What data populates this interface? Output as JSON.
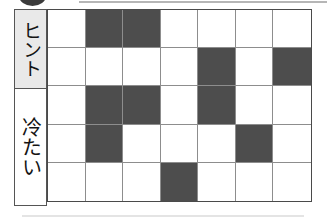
{
  "decorations": {
    "top_blob": "dark-circle-mark",
    "top_rule": "horizontal-divider",
    "bottom_rule": "horizontal-divider"
  },
  "labels": {
    "hint": "ヒント",
    "cold": "冷たい"
  },
  "colors": {
    "filled_cell": "#4d4d4d",
    "empty_cell": "#ffffff",
    "grid_line": "#8d8d8d",
    "grid_border": "#4a4a4a",
    "hint_background": "#e9e9e9",
    "cold_background": "#ffffff"
  },
  "grid": {
    "rows": 5,
    "columns": 7,
    "filled_label": "filled",
    "empty_label": "empty",
    "cells": [
      [
        0,
        1,
        1,
        0,
        0,
        0,
        0
      ],
      [
        0,
        0,
        0,
        0,
        1,
        0,
        1
      ],
      [
        0,
        1,
        1,
        0,
        1,
        0,
        0
      ],
      [
        0,
        1,
        0,
        0,
        0,
        1,
        0
      ],
      [
        0,
        0,
        0,
        1,
        0,
        0,
        0
      ]
    ]
  }
}
